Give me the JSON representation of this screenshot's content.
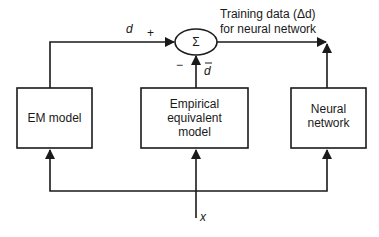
{
  "diagram": {
    "blocks": {
      "em_model": "EM model",
      "empirical_line1": "Empirical",
      "empirical_line2": "equivalent",
      "empirical_line3": "model",
      "neural_line1": "Neural",
      "neural_line2": "network"
    },
    "summer": {
      "symbol": "Σ",
      "plus_sign": "+",
      "minus_sign": "−"
    },
    "signals": {
      "d": "d",
      "d_bar": "d",
      "x": "x"
    },
    "output_label": {
      "line1": "Training data (Δd)",
      "line2": "for neural network"
    },
    "colors": {
      "stroke": "#1a1a1a",
      "background": "#ffffff"
    }
  }
}
